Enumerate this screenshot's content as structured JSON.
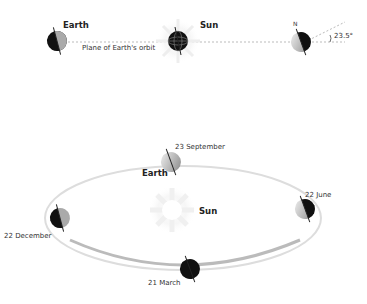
{
  "top": {
    "earth_label": "Earth",
    "sun_label": "Sun",
    "plane_label": "Plane of Earth's orbit",
    "north_label": "N",
    "tilt_label": "23.5°"
  },
  "orbit": {
    "earth_label": "Earth",
    "sun_label": "Sun",
    "positions": [
      {
        "label": "23 September"
      },
      {
        "label": "22 June"
      },
      {
        "label": "22 December"
      },
      {
        "label": "21 March"
      }
    ]
  }
}
